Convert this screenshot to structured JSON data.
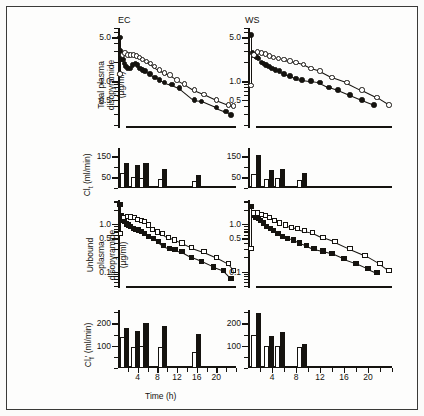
{
  "figure": {
    "panel_titles": {
      "left": "EC",
      "right": "WS"
    },
    "xaxis": {
      "title": "Time (h)",
      "ticklabels": [
        "4",
        "8",
        "12",
        "16",
        "20"
      ],
      "tickvalues": [
        4,
        8,
        12,
        16,
        20
      ],
      "min": 0,
      "max": 24,
      "minor_step": 2
    }
  },
  "chart_data": [
    {
      "id": "total-plasma-EC",
      "type": "scatter",
      "title": "EC",
      "xlabel": "Time (h)",
      "ylabel": "Total plasma disopyramide (µg/ml)",
      "yscale": "log",
      "ylim": [
        0.18,
        7.0
      ],
      "yticklabels": [
        "5.0",
        "1.0",
        "0.5"
      ],
      "ytickvalues": [
        5.0,
        1.0,
        0.5
      ],
      "xlim": [
        0,
        24
      ],
      "grid": false,
      "legend": "none",
      "series": [
        {
          "name": "filled-circle",
          "marker": "filled circle",
          "x": [
            0.4,
            0.5,
            0.6,
            0.7,
            0.8,
            1.0,
            1.3,
            1.6,
            2.0,
            2.5,
            3.0,
            3.5,
            4.0,
            4.5,
            5.0,
            5.5,
            6.5,
            7.5,
            8.5,
            9.5,
            11.0,
            12.5,
            15.5,
            17.0,
            20.0,
            22.0,
            23.0
          ],
          "y": [
            4.9,
            3.0,
            2.6,
            2.4,
            2.2,
            2.2,
            1.9,
            1.7,
            1.6,
            1.6,
            1.8,
            1.9,
            1.8,
            1.6,
            1.5,
            1.45,
            1.3,
            1.15,
            1.05,
            0.95,
            0.88,
            0.78,
            0.5,
            0.48,
            0.38,
            0.33,
            0.29
          ]
        },
        {
          "name": "open-circle",
          "marker": "open circle",
          "x": [
            0.4,
            0.9,
            1.4,
            2.0,
            2.6,
            3.2,
            3.8,
            4.4,
            5.0,
            5.8,
            6.6,
            7.4,
            8.4,
            9.4,
            10.6,
            12.0,
            13.5,
            15.5,
            17.5,
            20.0,
            22.5,
            23.5
          ],
          "y": [
            1.3,
            2.6,
            2.8,
            2.6,
            2.6,
            2.6,
            2.5,
            2.4,
            2.2,
            2.05,
            1.9,
            1.7,
            1.5,
            1.35,
            1.25,
            1.05,
            0.9,
            0.72,
            0.62,
            0.5,
            0.42,
            0.4
          ]
        }
      ]
    },
    {
      "id": "total-plasma-WS",
      "type": "scatter",
      "title": "WS",
      "xlabel": "Time (h)",
      "ylabel": "Total plasma disopyramide (µg/ml)",
      "yscale": "log",
      "ylim": [
        0.18,
        7.0
      ],
      "yticklabels": [
        "5.0",
        "1.0",
        "0.5"
      ],
      "ytickvalues": [
        5.0,
        1.0,
        0.5
      ],
      "xlim": [
        0,
        24
      ],
      "grid": false,
      "legend": "none",
      "series": [
        {
          "name": "filled-circle",
          "marker": "filled circle",
          "x": [
            0.5,
            0.8,
            1.0,
            1.2,
            1.5,
            1.8,
            2.2,
            2.6,
            3.0,
            3.5,
            4.0,
            4.6,
            5.2,
            6.0,
            7.0,
            8.0,
            9.0,
            10.5,
            12.0,
            13.5,
            15.0,
            17.0,
            19.0,
            21.0
          ],
          "y": [
            5.4,
            2.8,
            2.6,
            2.5,
            2.4,
            2.3,
            2.0,
            1.9,
            1.8,
            1.7,
            1.6,
            1.5,
            1.45,
            1.3,
            1.2,
            1.1,
            1.05,
            1.0,
            0.95,
            0.8,
            0.72,
            0.6,
            0.5,
            0.42
          ]
        },
        {
          "name": "open-circle",
          "marker": "open circle",
          "x": [
            0.5,
            1.0,
            1.6,
            2.2,
            2.9,
            3.6,
            4.3,
            5.1,
            6.0,
            7.0,
            8.0,
            9.2,
            10.5,
            12.0,
            14.0,
            16.5,
            19.0,
            21.5,
            23.5
          ],
          "y": [
            0.85,
            2.6,
            2.9,
            2.8,
            2.7,
            2.5,
            2.4,
            2.3,
            2.2,
            2.1,
            2.0,
            1.85,
            1.6,
            1.45,
            1.15,
            0.95,
            0.72,
            0.55,
            0.42
          ]
        }
      ]
    },
    {
      "id": "total-clearance-EC",
      "type": "bar",
      "title": "EC",
      "xlabel": "Time (h)",
      "ylabel": "Cl (ml/min)",
      "ylim": [
        0,
        190
      ],
      "yticklabels": [
        "150",
        "50"
      ],
      "ytickvalues": [
        150,
        50
      ],
      "xlim": [
        0,
        24
      ],
      "grid": false,
      "bars": [
        {
          "x": 1.0,
          "value": 72,
          "style": "open"
        },
        {
          "x": 1.8,
          "value": 120,
          "style": "filled"
        },
        {
          "x": 3.1,
          "value": 52,
          "style": "open"
        },
        {
          "x": 3.9,
          "value": 108,
          "style": "filled"
        },
        {
          "x": 4.9,
          "value": 48,
          "style": "open"
        },
        {
          "x": 5.7,
          "value": 120,
          "style": "filled"
        },
        {
          "x": 8.6,
          "value": 42,
          "style": "open"
        },
        {
          "x": 9.4,
          "value": 88,
          "style": "filled"
        },
        {
          "x": 15.6,
          "value": 35,
          "style": "open"
        },
        {
          "x": 16.4,
          "value": 62,
          "style": "filled"
        }
      ]
    },
    {
      "id": "total-clearance-WS",
      "type": "bar",
      "title": "WS",
      "xlabel": "Time (h)",
      "ylabel": "Cl (ml/min)",
      "ylim": [
        0,
        190
      ],
      "yticklabels": [
        "150",
        "50"
      ],
      "ytickvalues": [
        150,
        50
      ],
      "xlim": [
        0,
        24
      ],
      "grid": false,
      "bars": [
        {
          "x": 1.0,
          "value": 68,
          "style": "open"
        },
        {
          "x": 1.8,
          "value": 155,
          "style": "filled"
        },
        {
          "x": 3.1,
          "value": 45,
          "style": "open"
        },
        {
          "x": 3.9,
          "value": 86,
          "style": "filled"
        },
        {
          "x": 4.9,
          "value": 48,
          "style": "open"
        },
        {
          "x": 5.7,
          "value": 92,
          "style": "filled"
        },
        {
          "x": 8.6,
          "value": 38,
          "style": "open"
        },
        {
          "x": 9.4,
          "value": 72,
          "style": "filled"
        }
      ]
    },
    {
      "id": "unbound-plasma-EC",
      "type": "scatter",
      "title": "EC",
      "xlabel": "Time (h)",
      "ylabel": "Unbound plasma disopyramide (µg/ml)",
      "yscale": "log",
      "ylim": [
        0.045,
        3.2
      ],
      "yticklabels": [
        "1.0",
        "0.5",
        "0.1"
      ],
      "ytickvalues": [
        1.0,
        0.5,
        0.1
      ],
      "xlim": [
        0,
        24
      ],
      "grid": false,
      "legend": "none",
      "series": [
        {
          "name": "filled-square",
          "marker": "filled square",
          "x": [
            0.4,
            0.6,
            0.8,
            1.0,
            1.3,
            1.7,
            2.1,
            2.6,
            3.1,
            3.6,
            4.1,
            4.7,
            5.4,
            6.2,
            7.2,
            8.2,
            9.2,
            10.4,
            11.6,
            13.0,
            15.0,
            17.0,
            19.5,
            21.5,
            23.0
          ],
          "y": [
            2.6,
            1.5,
            1.3,
            1.2,
            1.15,
            1.0,
            0.95,
            0.88,
            0.8,
            0.78,
            0.75,
            0.7,
            0.62,
            0.55,
            0.5,
            0.42,
            0.35,
            0.31,
            0.29,
            0.26,
            0.2,
            0.165,
            0.125,
            0.105,
            0.072
          ]
        },
        {
          "name": "open-square",
          "marker": "open square",
          "x": [
            0.5,
            1.2,
            1.9,
            2.6,
            3.3,
            4.0,
            4.7,
            5.4,
            6.2,
            7.0,
            8.0,
            9.0,
            10.2,
            11.5,
            13.0,
            15.0,
            17.5,
            20.0,
            22.5,
            23.5
          ],
          "y": [
            0.62,
            1.35,
            1.45,
            1.4,
            1.35,
            1.25,
            1.2,
            1.15,
            0.95,
            0.78,
            0.68,
            0.62,
            0.52,
            0.46,
            0.4,
            0.32,
            0.26,
            0.2,
            0.145,
            0.105
          ]
        }
      ]
    },
    {
      "id": "unbound-plasma-WS",
      "type": "scatter",
      "title": "WS",
      "xlabel": "Time (h)",
      "ylabel": "Unbound plasma disopyramide (µg/ml)",
      "yscale": "log",
      "ylim": [
        0.045,
        3.2
      ],
      "yticklabels": [
        "1.0",
        "0.5",
        "0.1"
      ],
      "ytickvalues": [
        1.0,
        0.5,
        0.1
      ],
      "xlim": [
        0,
        24
      ],
      "grid": false,
      "legend": "none",
      "series": [
        {
          "name": "filled-square",
          "marker": "filled square",
          "x": [
            0.5,
            0.9,
            1.3,
            1.7,
            2.1,
            2.6,
            3.1,
            3.7,
            4.3,
            5.0,
            5.8,
            6.6,
            7.6,
            8.6,
            9.8,
            11.0,
            12.5,
            14.0,
            16.0,
            18.0,
            20.0,
            21.5
          ],
          "y": [
            2.3,
            1.55,
            1.4,
            1.3,
            1.2,
            1.05,
            0.9,
            0.8,
            0.72,
            0.62,
            0.55,
            0.5,
            0.46,
            0.4,
            0.35,
            0.3,
            0.27,
            0.24,
            0.185,
            0.15,
            0.115,
            0.095
          ]
        },
        {
          "name": "open-square",
          "marker": "open square",
          "x": [
            0.5,
            1.0,
            1.6,
            2.2,
            2.9,
            3.6,
            4.4,
            5.2,
            6.2,
            7.2,
            8.2,
            9.4,
            10.8,
            12.5,
            14.5,
            17.0,
            19.5,
            22.0,
            23.5
          ],
          "y": [
            0.3,
            1.7,
            1.7,
            1.6,
            1.5,
            1.35,
            1.2,
            1.05,
            0.95,
            0.85,
            0.8,
            0.72,
            0.66,
            0.52,
            0.42,
            0.3,
            0.22,
            0.145,
            0.105
          ]
        }
      ]
    },
    {
      "id": "unbound-clearance-EC",
      "type": "bar",
      "title": "EC",
      "xlabel": "Time (h)",
      "ylabel": "Cl' (ml/min)",
      "ylim": [
        0,
        260
      ],
      "yticklabels": [
        "200",
        "100"
      ],
      "ytickvalues": [
        200,
        100
      ],
      "xlim": [
        0,
        24
      ],
      "grid": false,
      "bars": [
        {
          "x": 1.0,
          "value": 140,
          "style": "open"
        },
        {
          "x": 1.8,
          "value": 178,
          "style": "filled"
        },
        {
          "x": 3.1,
          "value": 92,
          "style": "open"
        },
        {
          "x": 3.9,
          "value": 168,
          "style": "filled"
        },
        {
          "x": 4.9,
          "value": 97,
          "style": "open"
        },
        {
          "x": 5.7,
          "value": 200,
          "style": "filled"
        },
        {
          "x": 8.6,
          "value": 92,
          "style": "open"
        },
        {
          "x": 9.4,
          "value": 190,
          "style": "filled"
        },
        {
          "x": 15.6,
          "value": 72,
          "style": "open"
        },
        {
          "x": 16.4,
          "value": 152,
          "style": "filled"
        }
      ]
    },
    {
      "id": "unbound-clearance-WS",
      "type": "bar",
      "title": "WS",
      "xlabel": "Time (h)",
      "ylabel": "Cl' (ml/min)",
      "ylim": [
        0,
        260
      ],
      "yticklabels": [
        "200",
        "100"
      ],
      "ytickvalues": [
        200,
        100
      ],
      "xlim": [
        0,
        24
      ],
      "grid": false,
      "bars": [
        {
          "x": 1.0,
          "value": 148,
          "style": "open"
        },
        {
          "x": 1.8,
          "value": 248,
          "style": "filled"
        },
        {
          "x": 3.1,
          "value": 98,
          "style": "open"
        },
        {
          "x": 3.9,
          "value": 142,
          "style": "filled"
        },
        {
          "x": 4.9,
          "value": 100,
          "style": "open"
        },
        {
          "x": 5.7,
          "value": 162,
          "style": "filled"
        },
        {
          "x": 8.6,
          "value": 92,
          "style": "open"
        },
        {
          "x": 9.4,
          "value": 108,
          "style": "filled"
        }
      ]
    }
  ],
  "labels": {
    "y_total_plasma_l1": "Total plasma",
    "y_total_plasma_l2": "disopyramide",
    "y_total_plasma_l3": "(µg/ml)",
    "y_total_clearance": "Cl",
    "y_total_clearance_sub": "t",
    "y_total_clearance_unit": "(ml/min)",
    "y_unbound_l1": "Unbound",
    "y_unbound_l2": "plasma",
    "y_unbound_l3": "disopyramide",
    "y_unbound_l4": "(µg/ml)",
    "y_unbound_clearance": "Cl",
    "y_unbound_clearance_sub": "f",
    "y_unbound_clearance_prime": "'",
    "y_unbound_clearance_unit": "(ml/min)"
  }
}
